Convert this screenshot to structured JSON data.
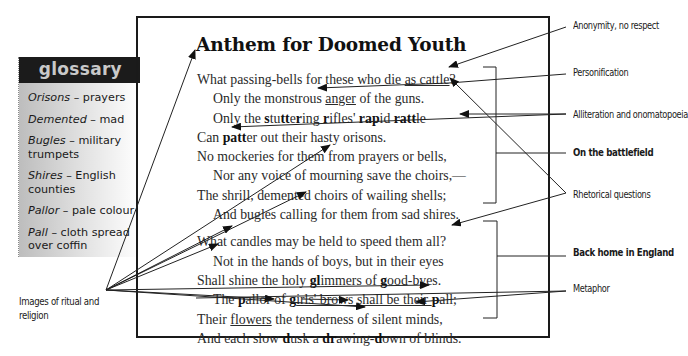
{
  "glossary": {
    "title": "glossary",
    "items": [
      {
        "term": "Orisons",
        "definition": " – prayers"
      },
      {
        "term": "Demented",
        "definition": " – mad"
      },
      {
        "term": "Bugles",
        "definition": " – military trumpets"
      },
      {
        "term": "Shires",
        "definition": " – English counties"
      },
      {
        "term": "Pallor",
        "definition": " – pale colour"
      },
      {
        "term": "Pall",
        "definition": " – cloth spread over coffin"
      }
    ]
  },
  "poem": {
    "title": "Anthem for Doomed Youth",
    "stanza1": {
      "l1a": "What passing-bells for these who die ",
      "l1u": "as cattle",
      "l1b": "?",
      "l2a": "Only the monstrous ",
      "l2u": "anger",
      "l2b": " of the guns.",
      "l3": [
        "Only the ",
        "s",
        "tu",
        "tt",
        "e",
        "r",
        "ing ",
        "r",
        "ifles' ",
        "ra",
        "p",
        "id ",
        "ra",
        "tt",
        "le"
      ],
      "l4": [
        "Can ",
        "patt",
        "er out their hasty orisons."
      ],
      "l5": "No mockeries for them from prayers or bells,",
      "l6": "Nor any voice of mourning save the choirs,—",
      "l7": "The shrill, demented choirs of wailing shells;",
      "l8": "And bugles calling for them from sad shires."
    },
    "stanza2": {
      "l1": "What candles may be held to speed them all?",
      "l2": "Not in the hands of boys, but in their eyes",
      "l3": [
        "Shall shine the holy ",
        "gl",
        "immers of ",
        "g",
        "ood-byes."
      ],
      "l4": [
        "The ",
        "p",
        "allor of ",
        "g",
        "irls' brows shall be their ",
        "p",
        "all;"
      ],
      "l5a": "Their ",
      "l5u": "flowers",
      "l5b": " the tenderness of silent minds,",
      "l6": [
        "And each slow ",
        "d",
        "usk a ",
        "dr",
        "awing-",
        "d",
        "own of blinds."
      ]
    }
  },
  "annotations": {
    "anonymity": "Anonymity, no respect",
    "personification": "Personification",
    "alliteration": "Alliteration and onomatopoeia",
    "battlefield": "On the battlefield",
    "rhetorical": "Rhetorical questions",
    "back_home": "Back home in England",
    "metaphor": "Metaphor",
    "ritual": "Images of ritual and religion"
  },
  "colors": {
    "frame": "#1a1a1a",
    "glossary_header_bg": "#1b1b1b",
    "glossary_header_text": "#c9c9c9",
    "glossary_bg_start": "#bdbdbd",
    "line": "#222222"
  }
}
